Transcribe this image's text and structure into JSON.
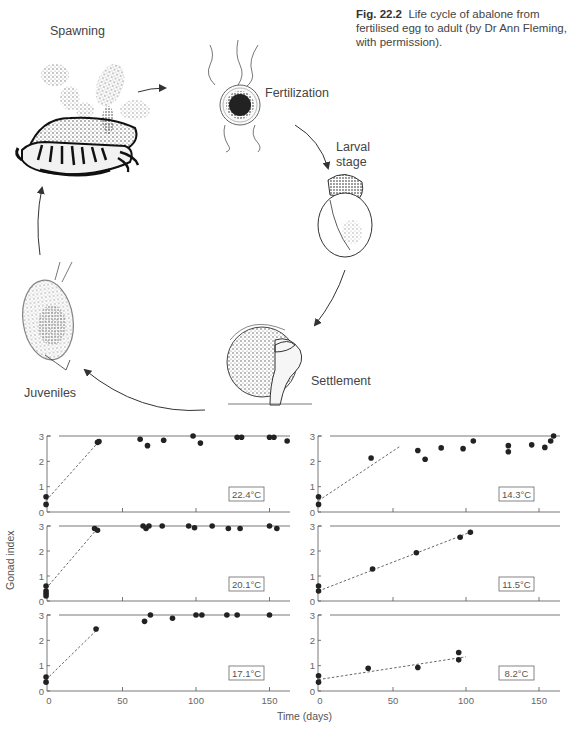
{
  "caption": {
    "figure_number": "Fig. 22.2",
    "text": "Life cycle of abalone from fertilised egg to adult (by Dr Ann Fleming, with permission)."
  },
  "life_cycle": {
    "stages": [
      {
        "label": "Spawning"
      },
      {
        "label": "Fertilization"
      },
      {
        "label": "Larval stage"
      },
      {
        "label": "Settlement"
      },
      {
        "label": "Juveniles"
      }
    ]
  },
  "axes": {
    "ylabel": "Gonad index",
    "xlabel": "Time (days)",
    "x_ticks": [
      "0",
      "50",
      "100",
      "150"
    ],
    "y_ticks": [
      "0",
      "1",
      "2",
      "3"
    ]
  },
  "chart_data": [
    {
      "type": "scatter",
      "title": "22.4°C",
      "xlabel": "Time (days)",
      "ylabel": "Gonad index",
      "xlim": [
        -3,
        165
      ],
      "ylim": [
        0,
        3
      ],
      "points": [
        [
          -2,
          0.3
        ],
        [
          -2,
          0.6
        ],
        [
          33,
          2.75
        ],
        [
          34,
          2.78
        ],
        [
          62,
          2.87
        ],
        [
          67,
          2.62
        ],
        [
          78,
          2.83
        ],
        [
          98,
          3.0
        ],
        [
          103,
          2.72
        ],
        [
          128,
          2.95
        ],
        [
          131,
          2.95
        ],
        [
          150,
          2.95
        ],
        [
          153,
          2.95
        ],
        [
          162,
          2.8
        ]
      ],
      "trend_line": [
        [
          -2,
          0.45
        ],
        [
          35,
          2.85
        ]
      ],
      "plateau": 3
    },
    {
      "type": "scatter",
      "title": "20.1°C",
      "xlabel": "Time (days)",
      "ylabel": "Gonad index",
      "xlim": [
        -3,
        165
      ],
      "ylim": [
        0,
        3
      ],
      "points": [
        [
          -2,
          0.2
        ],
        [
          -2,
          0.3
        ],
        [
          -2,
          0.4
        ],
        [
          -2,
          0.6
        ],
        [
          31,
          2.9
        ],
        [
          33,
          2.83
        ],
        [
          64,
          3.0
        ],
        [
          66,
          2.9
        ],
        [
          68,
          3.0
        ],
        [
          77,
          3.0
        ],
        [
          95,
          3.0
        ],
        [
          99,
          2.93
        ],
        [
          111,
          3.0
        ],
        [
          122,
          2.9
        ],
        [
          130,
          2.9
        ],
        [
          150,
          3.0
        ],
        [
          155,
          2.9
        ]
      ],
      "trend_line": [
        [
          -2,
          0.5
        ],
        [
          33,
          2.9
        ]
      ],
      "plateau": 3
    },
    {
      "type": "scatter",
      "title": "17.1°C",
      "xlabel": "Time (days)",
      "ylabel": "Gonad index",
      "xlim": [
        -3,
        165
      ],
      "ylim": [
        0,
        3
      ],
      "points": [
        [
          -2,
          0.35
        ],
        [
          -2,
          0.55
        ],
        [
          32,
          2.45
        ],
        [
          65,
          2.75
        ],
        [
          69,
          3.0
        ],
        [
          84,
          2.87
        ],
        [
          100,
          3.0
        ],
        [
          104,
          3.0
        ],
        [
          121,
          3.0
        ],
        [
          128,
          3.0
        ],
        [
          150,
          3.0
        ]
      ],
      "trend_line": [
        [
          -2,
          0.45
        ],
        [
          35,
          2.55
        ]
      ],
      "plateau": 3
    },
    {
      "type": "scatter",
      "title": "14.3°C",
      "xlabel": "Time (days)",
      "ylabel": "Gonad index",
      "xlim": [
        -3,
        165
      ],
      "ylim": [
        0,
        3
      ],
      "points": [
        [
          -1,
          0.3
        ],
        [
          -1,
          0.6
        ],
        [
          35,
          2.13
        ],
        [
          67,
          2.43
        ],
        [
          72,
          2.08
        ],
        [
          83,
          2.53
        ],
        [
          98,
          2.5
        ],
        [
          105,
          2.8
        ],
        [
          129,
          2.62
        ],
        [
          129,
          2.38
        ],
        [
          145,
          2.65
        ],
        [
          154,
          2.55
        ],
        [
          158,
          2.8
        ],
        [
          160,
          3.0
        ]
      ],
      "trend_line": [
        [
          -1,
          0.45
        ],
        [
          55,
          2.6
        ]
      ],
      "plateau": 3
    },
    {
      "type": "scatter",
      "title": "11.5°C",
      "xlabel": "Time (days)",
      "ylabel": "Gonad index",
      "xlim": [
        -3,
        165
      ],
      "ylim": [
        0,
        3
      ],
      "points": [
        [
          -1,
          0.4
        ],
        [
          -1,
          0.6
        ],
        [
          36,
          1.28
        ],
        [
          66,
          1.93
        ],
        [
          96,
          2.55
        ],
        [
          103,
          2.75
        ]
      ],
      "trend_line": [
        [
          -1,
          0.4
        ],
        [
          105,
          2.8
        ]
      ],
      "plateau": 3
    },
    {
      "type": "scatter",
      "title": "8.2°C",
      "xlabel": "Time (days)",
      "ylabel": "Gonad index",
      "xlim": [
        -3,
        165
      ],
      "ylim": [
        0,
        3
      ],
      "points": [
        [
          -1,
          0.35
        ],
        [
          -1,
          0.6
        ],
        [
          33,
          0.9
        ],
        [
          67,
          0.93
        ],
        [
          95,
          1.52
        ],
        [
          95,
          1.23
        ]
      ],
      "trend_line": [
        [
          -1,
          0.45
        ],
        [
          100,
          1.35
        ]
      ],
      "plateau": 3
    }
  ]
}
